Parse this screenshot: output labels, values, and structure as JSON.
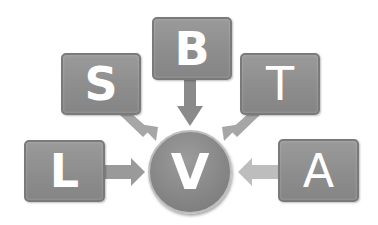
{
  "diagram": {
    "center": {
      "label": "V"
    },
    "nodes": [
      {
        "id": "B",
        "label": "B",
        "position": "top"
      },
      {
        "id": "S",
        "label": "S",
        "position": "top-left"
      },
      {
        "id": "T",
        "label": "T",
        "position": "top-right"
      },
      {
        "id": "L",
        "label": "L",
        "position": "left"
      },
      {
        "id": "A",
        "label": "A",
        "position": "right"
      }
    ],
    "edges": [
      {
        "from": "B",
        "to": "V"
      },
      {
        "from": "S",
        "to": "V"
      },
      {
        "from": "T",
        "to": "V"
      },
      {
        "from": "L",
        "to": "V"
      },
      {
        "from": "A",
        "to": "V"
      }
    ],
    "colors": {
      "box": "#8c8c8c",
      "arrow_dark": "#8a8a8a",
      "arrow_light": "#b4b4b4",
      "text": "#ffffff"
    }
  }
}
